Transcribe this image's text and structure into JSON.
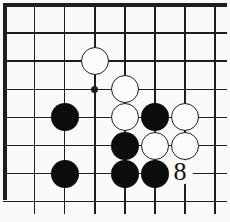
{
  "figure": {
    "kind": "go-board-diagram",
    "board": {
      "grid": {
        "cols": 8,
        "rows": 8,
        "origin_x": 4.5,
        "origin_y": 5,
        "col_spacing": 30.1,
        "row_spacing": 28.1,
        "thick_top_edge": true,
        "thick_left_edge": true,
        "hline_start_x": 3,
        "hline_length": 224,
        "vline_start_y": 3,
        "vline_length": 211,
        "edge_vline_length": 197,
        "thick_px": 4,
        "thin_px": 1.5
      },
      "colors": {
        "line": "#1e1e1e",
        "background": "#fafafa",
        "black_stone": "#0c0c0c",
        "white_stone": "#fcfcfc"
      },
      "stone_diameter": 28,
      "stones": [
        {
          "color": "white",
          "col": 3,
          "row": 2
        },
        {
          "color": "white",
          "col": 4,
          "row": 3
        },
        {
          "color": "white",
          "col": 4,
          "row": 4
        },
        {
          "color": "white",
          "col": 6,
          "row": 4
        },
        {
          "color": "white",
          "col": 5,
          "row": 5
        },
        {
          "color": "white",
          "col": 6,
          "row": 5
        },
        {
          "color": "black",
          "col": 2,
          "row": 4
        },
        {
          "color": "black",
          "col": 5,
          "row": 4
        },
        {
          "color": "black",
          "col": 4,
          "row": 5
        },
        {
          "color": "black",
          "col": 2,
          "row": 6
        },
        {
          "color": "black",
          "col": 4,
          "row": 6
        },
        {
          "color": "black",
          "col": 5,
          "row": 6
        }
      ],
      "markers": [
        {
          "type": "star-point",
          "col": 3,
          "row": 3,
          "diameter": 7
        }
      ],
      "labels": [
        {
          "text": "8",
          "col": 6,
          "row": 6,
          "dx": -5,
          "dy": -2
        }
      ]
    }
  }
}
